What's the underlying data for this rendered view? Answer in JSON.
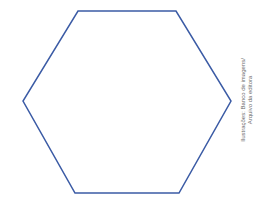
{
  "figure": {
    "shape": "hexagon",
    "stroke_color": "#3b5ba5",
    "fill_color": "none",
    "stroke_width": 1.5,
    "vertices": [
      [
        78,
        11
      ],
      [
        176,
        11
      ],
      [
        231,
        101
      ],
      [
        179,
        193
      ],
      [
        75,
        193
      ],
      [
        23,
        101
      ]
    ],
    "points": "78,11 176,11 231,101 179,193 75,193 23,101"
  },
  "credit": {
    "line1": "Ilustrações: Banco de imagens/",
    "line2": "Arquivo da editora",
    "color": "#6b6b6b"
  }
}
